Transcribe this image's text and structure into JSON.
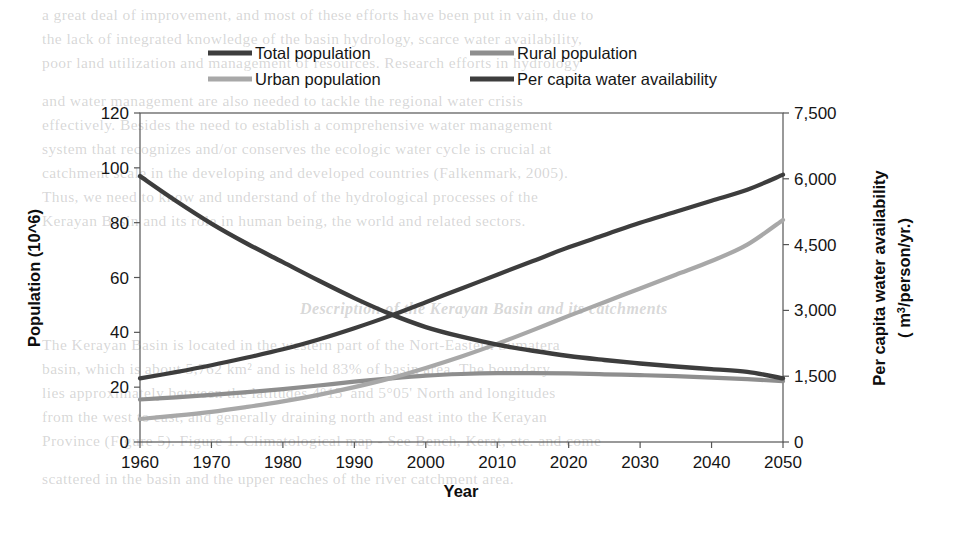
{
  "chart_data": {
    "type": "line",
    "title": "",
    "xlabel": "Year",
    "ylabel": "Population (10^6)",
    "y2label_line1": "Per capita water availability",
    "y2label_line2": "( m",
    "y2label_sup": "3",
    "y2label_line3": "/person/yr.)",
    "grid": false,
    "legend_position": "top",
    "x": [
      1960,
      1965,
      1970,
      1975,
      1980,
      1985,
      1990,
      1995,
      2000,
      2005,
      2010,
      2015,
      2020,
      2025,
      2030,
      2035,
      2040,
      2045,
      2050
    ],
    "xlim": [
      1960,
      2050
    ],
    "xticks": [
      1960,
      1970,
      1980,
      1990,
      2000,
      2010,
      2020,
      2030,
      2040,
      2050
    ],
    "xtick_labels": [
      "1960",
      "1970",
      "1980",
      "1990",
      "2000",
      "2010",
      "2020",
      "2030",
      "2040",
      "2050"
    ],
    "ylim": [
      0,
      120
    ],
    "yticks": [
      0,
      20,
      40,
      60,
      80,
      100,
      120
    ],
    "ytick_labels": [
      "0",
      "20",
      "40",
      "60",
      "80",
      "100",
      "120"
    ],
    "y2lim": [
      0,
      7500
    ],
    "y2ticks": [
      0,
      1500,
      3000,
      4500,
      6000,
      7500
    ],
    "y2tick_labels": [
      "0",
      "1,500",
      "3,000",
      "4,500",
      "6,000",
      "7,500"
    ],
    "series": [
      {
        "name": "Total population",
        "axis": "left",
        "units": "10^6",
        "color": "#3d3d3d",
        "width": 4.2,
        "values": [
          23.2,
          25.5,
          28.0,
          30.8,
          33.8,
          37.4,
          41.5,
          46.0,
          51.0,
          56.0,
          61.0,
          66.0,
          71.0,
          75.5,
          80.0,
          84.0,
          88.0,
          92.0,
          97.5
        ]
      },
      {
        "name": "Rural population",
        "axis": "left",
        "units": "10^6",
        "color": "#8e8e8e",
        "width": 4.2,
        "values": [
          15.5,
          16.3,
          17.2,
          18.2,
          19.3,
          20.6,
          22.0,
          23.2,
          24.2,
          24.8,
          25.1,
          25.1,
          25.0,
          24.7,
          24.4,
          24.0,
          23.5,
          22.9,
          22.2
        ]
      },
      {
        "name": "Urban population",
        "axis": "left",
        "units": "10^6",
        "color": "#a8a8a8",
        "width": 4.2,
        "values": [
          8.4,
          9.6,
          11.0,
          12.8,
          14.8,
          17.2,
          20.0,
          23.2,
          27.0,
          31.2,
          35.8,
          40.8,
          46.0,
          51.0,
          56.0,
          61.0,
          66.0,
          72.0,
          81.0
        ]
      },
      {
        "name": "Per capita water availability",
        "axis": "right",
        "units": "m3/person/yr.",
        "color": "#3d3d3d",
        "width": 4.4,
        "values": [
          6060,
          5500,
          4980,
          4520,
          4100,
          3680,
          3280,
          2920,
          2620,
          2400,
          2220,
          2080,
          1960,
          1870,
          1790,
          1720,
          1660,
          1600,
          1450
        ]
      }
    ],
    "legend": [
      {
        "label": "Total population",
        "color": "#3d3d3d"
      },
      {
        "label": "Rural population",
        "color": "#8e8e8e"
      },
      {
        "label": "Urban population",
        "color": "#a8a8a8"
      },
      {
        "label": "Per capita water availability",
        "color": "#3d3d3d"
      }
    ],
    "annotations": {
      "crossover_water_total": "1984",
      "crossover_urban_rural": "1993"
    }
  },
  "background_text": {
    "lines": [
      {
        "text": "a great deal of improvement, and most of these efforts have been put in vain, due to",
        "x": 42,
        "y": 6,
        "size": 15.5,
        "italic": false
      },
      {
        "text": "the lack of integrated knowledge of the basin hydrology, scarce water availability,",
        "x": 42,
        "y": 30,
        "size": 15.5,
        "italic": false
      },
      {
        "text": "poor land utilization and management of resources. Research efforts in hydrology",
        "x": 42,
        "y": 54,
        "size": 15.5,
        "italic": false
      },
      {
        "text": "and water management are also needed to tackle the regional water crisis",
        "x": 42,
        "y": 92,
        "size": 15.5,
        "italic": false
      },
      {
        "text": "effectively. Besides the need to establish a comprehensive water management",
        "x": 42,
        "y": 116,
        "size": 15.5,
        "italic": false
      },
      {
        "text": "system that recognizes and/or conserves the ecologic water cycle is crucial at",
        "x": 42,
        "y": 140,
        "size": 15.5,
        "italic": false
      },
      {
        "text": "catchment scale in the developing and developed countries (Falkenmark, 2005).",
        "x": 42,
        "y": 164,
        "size": 15.5,
        "italic": false
      },
      {
        "text": "Thus, we need to know and understand of the hydrological processes of the",
        "x": 42,
        "y": 188,
        "size": 15.5,
        "italic": false
      },
      {
        "text": "Kerayan Basin and its role in human being, the world and related sectors.",
        "x": 42,
        "y": 212,
        "size": 15.5,
        "italic": false
      },
      {
        "text": "Description of the Kerayan Basin and its catchments",
        "x": 300,
        "y": 300,
        "size": 16,
        "italic": true
      },
      {
        "text": "The Kerayan Basin is located in the western part of the Nort-Eastern Sumatera",
        "x": 42,
        "y": 336,
        "size": 15.5,
        "italic": false
      },
      {
        "text": "basin, which is about 5,762 km² and is held 83% of basin area. The boundary",
        "x": 42,
        "y": 360,
        "size": 15.5,
        "italic": false
      },
      {
        "text": "lies approximately between the latitudes 4°15' and 5°05' North and longitudes",
        "x": 42,
        "y": 384,
        "size": 15.5,
        "italic": false
      },
      {
        "text": "from the west to east, and generally draining north and east into the Kerayan",
        "x": 42,
        "y": 408,
        "size": 15.5,
        "italic": false
      },
      {
        "text": "Province (Figure 5). Figure 1. Climatological map - See Bench, Kerat, etc. and come",
        "x": 42,
        "y": 432,
        "size": 15.5,
        "italic": false
      },
      {
        "text": "scattered in the basin and the upper reaches of the river catchment area.",
        "x": 42,
        "y": 470,
        "size": 15.5,
        "italic": false
      }
    ]
  }
}
